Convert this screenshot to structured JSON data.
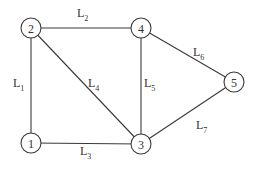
{
  "diagram": {
    "type": "graph",
    "nodes": [
      {
        "id": "1",
        "label": "1",
        "x": 31,
        "y": 143
      },
      {
        "id": "2",
        "label": "2",
        "x": 31,
        "y": 28
      },
      {
        "id": "3",
        "label": "3",
        "x": 141,
        "y": 144
      },
      {
        "id": "4",
        "label": "4",
        "x": 141,
        "y": 28
      },
      {
        "id": "5",
        "label": "5",
        "x": 234,
        "y": 82
      }
    ],
    "edges": [
      {
        "id": "L1",
        "from": "2",
        "to": "1",
        "label_main": "L",
        "label_sub": "1",
        "lx": 13,
        "ly": 87
      },
      {
        "id": "L2",
        "from": "2",
        "to": "4",
        "label_main": "L",
        "label_sub": "2",
        "lx": 77,
        "ly": 17
      },
      {
        "id": "L3",
        "from": "1",
        "to": "3",
        "label_main": "L",
        "label_sub": "3",
        "lx": 80,
        "ly": 155
      },
      {
        "id": "L4",
        "from": "2",
        "to": "3",
        "label_main": "L",
        "label_sub": "4",
        "lx": 88,
        "ly": 87
      },
      {
        "id": "L5",
        "from": "4",
        "to": "3",
        "label_main": "L",
        "label_sub": "5",
        "lx": 144,
        "ly": 87
      },
      {
        "id": "L6",
        "from": "4",
        "to": "5",
        "label_main": "L",
        "label_sub": "6",
        "lx": 193,
        "ly": 56
      },
      {
        "id": "L7",
        "from": "3",
        "to": "5",
        "label_main": "L",
        "label_sub": "7",
        "lx": 196,
        "ly": 129
      }
    ]
  }
}
